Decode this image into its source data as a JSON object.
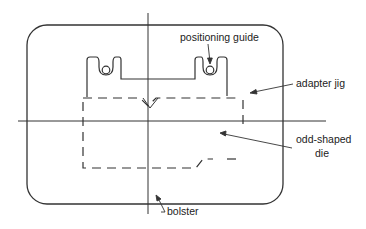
{
  "diagram": {
    "type": "technical-schematic",
    "stroke_color": "#333333",
    "background": "#ffffff",
    "labels": {
      "positioning_guide": "positioning guide",
      "adapter_jig": "adapter jig",
      "odd_shaped_die_line1": "odd-shaped",
      "odd_shaped_die_line2": "die",
      "bolster": "bolster"
    },
    "components": [
      {
        "id": "bolster",
        "shape": "rounded-rectangle",
        "style": "solid"
      },
      {
        "id": "adapter-jig",
        "shape": "notched-plate",
        "style": "solid",
        "positioning_guides": 2
      },
      {
        "id": "odd-shaped-die",
        "shape": "irregular-outline",
        "style": "dashed"
      },
      {
        "id": "center-lines",
        "shape": "crosshair",
        "style": "solid"
      }
    ]
  }
}
